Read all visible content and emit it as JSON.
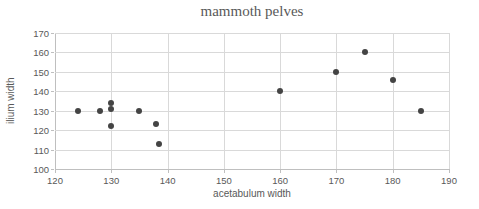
{
  "chart_data": {
    "type": "scatter",
    "title": "mammoth pelves",
    "xlabel": "acetabulum width",
    "ylabel": "ilium width",
    "xlim": [
      120,
      190
    ],
    "ylim": [
      100,
      170
    ],
    "xticks": [
      120,
      130,
      140,
      150,
      160,
      170,
      180,
      190
    ],
    "yticks": [
      100,
      110,
      120,
      130,
      140,
      150,
      160,
      170
    ],
    "grid": true,
    "legend": "none",
    "points": [
      {
        "x": 124,
        "y": 130
      },
      {
        "x": 128,
        "y": 130
      },
      {
        "x": 130,
        "y": 134
      },
      {
        "x": 130,
        "y": 131
      },
      {
        "x": 130,
        "y": 122
      },
      {
        "x": 135,
        "y": 130
      },
      {
        "x": 138,
        "y": 123
      },
      {
        "x": 138.5,
        "y": 113
      },
      {
        "x": 160,
        "y": 140
      },
      {
        "x": 170,
        "y": 150
      },
      {
        "x": 175,
        "y": 160
      },
      {
        "x": 180,
        "y": 146
      },
      {
        "x": 185,
        "y": 130
      }
    ],
    "colors": {
      "marker": "#444444",
      "gridline": "#d9d9d9",
      "axis_line": "#bfbfbf",
      "text": "#595959",
      "background": "#ffffff"
    }
  }
}
